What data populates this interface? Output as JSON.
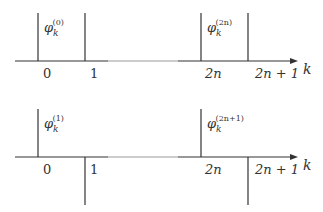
{
  "diagram": {
    "axis_variable": "k",
    "top_panel": {
      "function_left": {
        "symbol": "φ",
        "subscript": "k",
        "superscript": "(0)"
      },
      "function_right": {
        "symbol": "φ",
        "subscript": "k",
        "superscript": "(2n)"
      },
      "ticks": [
        "0",
        "1",
        "2n",
        "2n + 1"
      ],
      "description": "Left: box from 0 to 1 pointing up. Right: box from 2n to 2n+1 pointing up."
    },
    "bottom_panel": {
      "function_left": {
        "symbol": "φ",
        "subscript": "k",
        "superscript": "(1)"
      },
      "function_right": {
        "symbol": "φ",
        "subscript": "k",
        "superscript": "(2n+1)"
      },
      "ticks": [
        "0",
        "1",
        "2n",
        "2n + 1"
      ],
      "description": "Up spike at 0 and down spike at 1; up spike at 2n and down spike at 2n+1."
    }
  },
  "colors": {
    "line": "#333333",
    "axis_faded": "#9a9a9a",
    "background": "#ffffff"
  }
}
